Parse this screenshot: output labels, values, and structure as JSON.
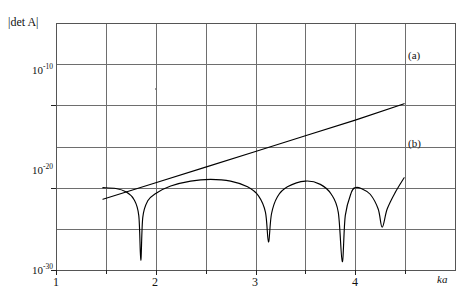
{
  "figure": {
    "title": "",
    "background_color": "#ffffff",
    "frame_color": "#555555",
    "grid_color": "#6e6e6e",
    "curve_color": "#000000"
  },
  "axes": {
    "ylabel": "|det A|",
    "ylabel_parts": {
      "bar_left": "|",
      "det": "det",
      "matrix": "A",
      "bar_right": "|"
    },
    "xlabel": "ka",
    "ytick_labels": [
      "10",
      "10",
      "10"
    ],
    "ytick_exponents": [
      "-10",
      "-20",
      "-30"
    ],
    "ytick_values": [
      -10,
      -20,
      -30
    ],
    "xtick_labels": [
      "1",
      "2",
      "3",
      "4"
    ],
    "xtick_values": [
      1,
      2,
      3,
      4
    ],
    "xminor_values": [
      1.5,
      2.5,
      3.5,
      4.5
    ],
    "xlim": [
      1,
      5
    ],
    "ylim": [
      -30,
      0
    ]
  },
  "annotations": [
    {
      "name": "curve-a-label",
      "text": "(a)",
      "x": 4.52,
      "y": -9.0
    },
    {
      "name": "curve-b-label",
      "text": "(b)",
      "x": 4.52,
      "y": -18.6
    }
  ],
  "chart_data": {
    "type": "line",
    "title": "",
    "xlabel": "ka",
    "ylabel": "|det A|",
    "xlim": [
      1,
      5
    ],
    "ylim": [
      1e-30,
      0.01
    ],
    "yscale": "log",
    "grid": true,
    "legend": "inline-annotations",
    "series": [
      {
        "name": "(a)",
        "label": "(a)",
        "kind": "straight-line",
        "x": [
          1.47,
          4.49
        ],
        "log10_y": [
          -21.4,
          -9.8
        ],
        "points": [
          {
            "x": 1.47,
            "log10_y": -21.4
          },
          {
            "x": 2.0,
            "log10_y": -19.4
          },
          {
            "x": 2.5,
            "log10_y": -17.5
          },
          {
            "x": 3.0,
            "log10_y": -15.6
          },
          {
            "x": 3.5,
            "log10_y": -13.7
          },
          {
            "x": 4.0,
            "log10_y": -11.8
          },
          {
            "x": 4.49,
            "log10_y": -9.8
          }
        ]
      },
      {
        "name": "(b)",
        "label": "(b)",
        "kind": "oscillatory-with-zeros",
        "zeros_x": [
          1.85,
          3.13,
          3.87,
          4.27
        ],
        "peaks": [
          {
            "x": 2.55,
            "log10_y": -19.0
          },
          {
            "x": 3.5,
            "log10_y": -19.2
          },
          {
            "x": 4.0,
            "log10_y": -20.0
          }
        ],
        "points": [
          {
            "x": 1.47,
            "log10_y": -20.0
          },
          {
            "x": 1.6,
            "log10_y": -20.1
          },
          {
            "x": 1.7,
            "log10_y": -20.5
          },
          {
            "x": 1.78,
            "log10_y": -21.4
          },
          {
            "x": 1.83,
            "log10_y": -23.4
          },
          {
            "x": 1.85,
            "log10_y": -28.8
          },
          {
            "x": 1.87,
            "log10_y": -23.6
          },
          {
            "x": 1.92,
            "log10_y": -21.6
          },
          {
            "x": 2.0,
            "log10_y": -20.7
          },
          {
            "x": 2.15,
            "log10_y": -19.8
          },
          {
            "x": 2.35,
            "log10_y": -19.2
          },
          {
            "x": 2.55,
            "log10_y": -19.0
          },
          {
            "x": 2.75,
            "log10_y": -19.2
          },
          {
            "x": 2.92,
            "log10_y": -19.9
          },
          {
            "x": 3.03,
            "log10_y": -21.0
          },
          {
            "x": 3.1,
            "log10_y": -23.0
          },
          {
            "x": 3.13,
            "log10_y": -26.6
          },
          {
            "x": 3.16,
            "log10_y": -23.2
          },
          {
            "x": 3.22,
            "log10_y": -21.1
          },
          {
            "x": 3.32,
            "log10_y": -19.9
          },
          {
            "x": 3.5,
            "log10_y": -19.2
          },
          {
            "x": 3.65,
            "log10_y": -19.6
          },
          {
            "x": 3.76,
            "log10_y": -20.8
          },
          {
            "x": 3.83,
            "log10_y": -23.0
          },
          {
            "x": 3.87,
            "log10_y": -29.0
          },
          {
            "x": 3.9,
            "log10_y": -23.4
          },
          {
            "x": 3.96,
            "log10_y": -20.6
          },
          {
            "x": 4.0,
            "log10_y": -20.0
          },
          {
            "x": 4.06,
            "log10_y": -20.1
          },
          {
            "x": 4.15,
            "log10_y": -20.8
          },
          {
            "x": 4.23,
            "log10_y": -22.6
          },
          {
            "x": 4.27,
            "log10_y": -24.8
          },
          {
            "x": 4.32,
            "log10_y": -22.6
          },
          {
            "x": 4.4,
            "log10_y": -20.6
          },
          {
            "x": 4.49,
            "log10_y": -18.8
          }
        ]
      }
    ]
  }
}
